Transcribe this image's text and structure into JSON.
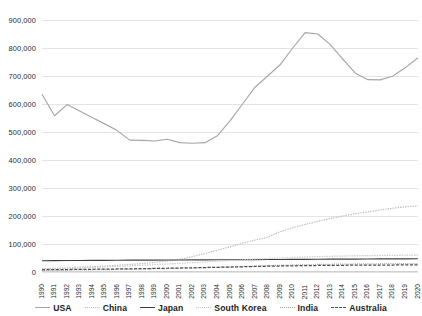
{
  "chart_data": {
    "type": "line",
    "title": "",
    "subtitle": "",
    "xlabel": "",
    "ylabel": "",
    "ylim": [
      0,
      900000
    ],
    "y_ticks": [
      "0",
      "100,000",
      "200,000",
      "300,000",
      "400,000",
      "500,000",
      "600,000",
      "700,000",
      "800,000",
      "900,000"
    ],
    "y_tick_values": [
      0,
      100000,
      200000,
      300000,
      400000,
      500000,
      600000,
      700000,
      800000,
      900000
    ],
    "grid": "horizontal",
    "legend_position": "bottom",
    "x": [
      "1990",
      "1991",
      "1992",
      "1993",
      "1994",
      "1995",
      "1996",
      "1997",
      "1998",
      "1999",
      "2000",
      "2001",
      "2002",
      "2003",
      "2004",
      "2005",
      "2006",
      "2007",
      "2008",
      "2009",
      "2010",
      "2011",
      "2012",
      "2013",
      "2014",
      "2015",
      "2016",
      "2017",
      "2018",
      "2019",
      "2020"
    ],
    "categories": [
      "1990",
      "1991",
      "1992",
      "1993",
      "1994",
      "1995",
      "1996",
      "1997",
      "1998",
      "1999",
      "2000",
      "2001",
      "2002",
      "2003",
      "2004",
      "2005",
      "2006",
      "2007",
      "2008",
      "2009",
      "2010",
      "2011",
      "2012",
      "2013",
      "2014",
      "2015",
      "2016",
      "2017",
      "2018",
      "2019",
      "2020"
    ],
    "series": [
      {
        "name": "USA",
        "color": "#a6a6a6",
        "style": "solid",
        "values": [
          635000,
          558000,
          598000,
          575000,
          552000,
          529000,
          505000,
          471000,
          470000,
          468000,
          474000,
          462000,
          460000,
          462000,
          487000,
          540000,
          600000,
          660000,
          700000,
          740000,
          800000,
          855000,
          850000,
          812000,
          760000,
          710000,
          687000,
          686000,
          700000,
          730000,
          765000
        ]
      },
      {
        "name": "China",
        "color": "#bfbfbf",
        "style": "dotted",
        "values": [
          12000,
          13000,
          15000,
          17000,
          19000,
          21000,
          24000,
          27000,
          30000,
          34000,
          39000,
          46000,
          55000,
          66000,
          78000,
          90000,
          103000,
          114000,
          124000,
          144000,
          158000,
          170000,
          181000,
          191000,
          200000,
          208000,
          215000,
          222000,
          228000,
          233000,
          236000
        ]
      },
      {
        "name": "Japan",
        "color": "#404040",
        "style": "solid",
        "values": [
          40000,
          40500,
          41000,
          41200,
          41500,
          41800,
          42000,
          42200,
          42400,
          42600,
          42800,
          43000,
          43200,
          43400,
          43600,
          43800,
          44000,
          44200,
          44500,
          44800,
          45000,
          45200,
          45500,
          45800,
          46000,
          46200,
          46500,
          46700,
          46900,
          47000,
          47200
        ]
      },
      {
        "name": "South Korea",
        "color": "#c9c9c9",
        "style": "dotted",
        "values": [
          11000,
          12000,
          13500,
          15000,
          16500,
          18000,
          20000,
          22000,
          24000,
          26000,
          28500,
          31000,
          33500,
          36000,
          38500,
          41000,
          43500,
          46000,
          48000,
          50000,
          52000,
          53500,
          55000,
          56000,
          57000,
          57800,
          58400,
          59000,
          59500,
          60000,
          60500
        ]
      },
      {
        "name": "India",
        "color": "#a0a0a0",
        "style": "fine-dotted",
        "values": [
          6000,
          6500,
          7000,
          7500,
          8000,
          8600,
          9200,
          10000,
          10800,
          11600,
          12500,
          13500,
          14500,
          15600,
          16800,
          18000,
          19500,
          21000,
          22500,
          24000,
          25200,
          26200,
          27000,
          27600,
          28200,
          28700,
          29100,
          29500,
          29800,
          30000,
          30200
        ]
      },
      {
        "name": "Australia",
        "color": "#4d4d4d",
        "style": "dashed",
        "values": [
          8000,
          8400,
          8800,
          9200,
          9700,
          10200,
          10800,
          11400,
          12000,
          12700,
          13400,
          14200,
          15000,
          15900,
          16800,
          17700,
          18700,
          19700,
          20600,
          21400,
          22100,
          22700,
          23200,
          23600,
          24000,
          24300,
          24600,
          24800,
          25000,
          25200,
          25400
        ]
      }
    ]
  },
  "legend": {
    "items": [
      {
        "label": "USA"
      },
      {
        "label": "China"
      },
      {
        "label": "Japan"
      },
      {
        "label": "South Korea"
      },
      {
        "label": "India"
      },
      {
        "label": "Australia"
      }
    ]
  }
}
